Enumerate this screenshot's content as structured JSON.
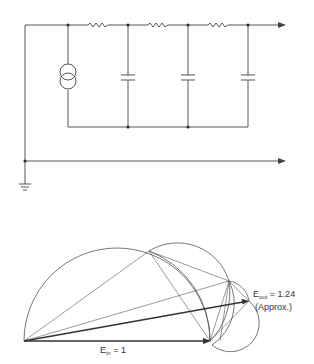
{
  "circuit": {
    "components": {
      "resistors": [
        "R1",
        "R2",
        "R3"
      ],
      "capacitors": [
        "C1",
        "C2",
        "C3"
      ],
      "source": "current-source"
    }
  },
  "vector_diagram": {
    "ein_label": {
      "main": "E",
      "sub": "in",
      "rest": " = 1"
    },
    "eout_label": {
      "main": "E",
      "sub": "out",
      "rest": " = 1.24"
    },
    "approx_label": "(Approx.)"
  }
}
